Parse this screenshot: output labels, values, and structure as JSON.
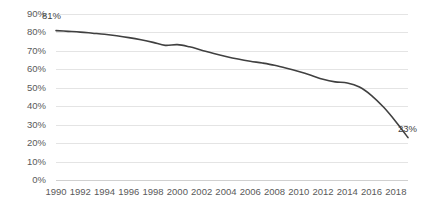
{
  "chart_data": {
    "type": "line",
    "title": "",
    "subtitle": "",
    "xlabel": "",
    "ylabel": "",
    "ylim": [
      0,
      90
    ],
    "xlim": [
      1990,
      2019
    ],
    "grid": true,
    "legend": false,
    "legend_position": "none",
    "y_tick_labels": [
      "90%",
      "80%",
      "70%",
      "60%",
      "50%",
      "40%",
      "30%",
      "20%",
      "10%",
      "0%"
    ],
    "y_tick_values": [
      90,
      80,
      70,
      60,
      50,
      40,
      30,
      20,
      10,
      0
    ],
    "x_tick_labels": [
      "1990",
      "1992",
      "1994",
      "1996",
      "1998",
      "2000",
      "2002",
      "2004",
      "2006",
      "2008",
      "2010",
      "2012",
      "2014",
      "2016",
      "2018"
    ],
    "x_tick_values": [
      1990,
      1992,
      1994,
      1996,
      1998,
      2000,
      2002,
      2004,
      2006,
      2008,
      2010,
      2012,
      2014,
      2016,
      2018
    ],
    "x": [
      1990,
      1991,
      1992,
      1993,
      1994,
      1995,
      1996,
      1997,
      1998,
      1999,
      2000,
      2001,
      2002,
      2003,
      2004,
      2005,
      2006,
      2007,
      2008,
      2009,
      2010,
      2011,
      2012,
      2013,
      2014,
      2015,
      2016,
      2017,
      2018,
      2019
    ],
    "values": [
      81,
      80.6,
      80.2,
      79.6,
      79.0,
      78.2,
      77.2,
      76.0,
      74.6,
      73.0,
      73.4,
      72.2,
      70.4,
      68.6,
      67.0,
      65.6,
      64.4,
      63.4,
      62.2,
      60.6,
      58.8,
      56.8,
      54.6,
      53.2,
      52.6,
      50.4,
      45.8,
      39.4,
      31.6,
      23
    ],
    "series": [
      {
        "name": "series-1",
        "color": "#404040",
        "values": [
          81,
          80.6,
          80.2,
          79.6,
          79.0,
          78.2,
          77.2,
          76.0,
          74.6,
          73.0,
          73.4,
          72.2,
          70.4,
          68.6,
          67.0,
          65.6,
          64.4,
          63.4,
          62.2,
          60.6,
          58.8,
          56.8,
          54.6,
          53.2,
          52.6,
          50.4,
          45.8,
          39.4,
          31.6,
          23
        ]
      }
    ],
    "annotations": [
      {
        "name": "start-label",
        "text": "81%",
        "x": 1990,
        "y": 81
      },
      {
        "name": "end-label",
        "text": "23%",
        "x": 2019,
        "y": 23
      }
    ],
    "colors": {
      "line": "#404040",
      "gridline": "#e4e4e4",
      "axis": "#d0d0d0",
      "tick_text": "#5a5a5a",
      "label_text": "#3f3f3f",
      "background": "#ffffff"
    }
  }
}
